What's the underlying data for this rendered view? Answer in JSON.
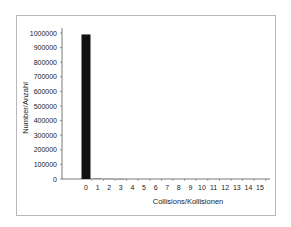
{
  "chart_data": {
    "type": "bar",
    "title": "",
    "xlabel": "Collisions/Kollisionen",
    "ylabel": "Number/Anzahl",
    "categories": [
      "0",
      "1",
      "2",
      "3",
      "4",
      "5",
      "6",
      "7",
      "8",
      "9",
      "10",
      "11",
      "12",
      "13",
      "14",
      "15"
    ],
    "values": [
      990000,
      6000,
      3000,
      1000,
      0,
      0,
      0,
      0,
      0,
      0,
      0,
      0,
      0,
      0,
      0,
      0
    ],
    "ylim": [
      0,
      1000000
    ],
    "yticks": [
      "0",
      "100000",
      "200000",
      "300000",
      "400000",
      "500000",
      "600000",
      "700000",
      "800000",
      "900000",
      "1000000"
    ],
    "grid": false,
    "legend": null,
    "bar_color": "#111111"
  }
}
